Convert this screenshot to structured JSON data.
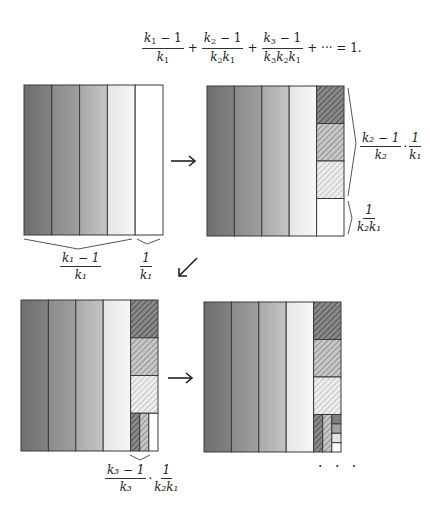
{
  "equation": {
    "terms": [
      {
        "num_var": "k",
        "num_sub": "1",
        "num_rest": " − 1",
        "den": [
          [
            "k",
            "1"
          ]
        ]
      },
      {
        "num_var": "k",
        "num_sub": "2",
        "num_rest": " − 1",
        "den": [
          [
            "k",
            "2"
          ],
          [
            "k",
            "1"
          ]
        ]
      },
      {
        "num_var": "k",
        "num_sub": "3",
        "num_rest": " − 1",
        "den": [
          [
            "k",
            "3"
          ],
          [
            "k",
            "2"
          ],
          [
            "k",
            "1"
          ]
        ]
      }
    ],
    "plus": "+",
    "tail": "+ ··· = 1."
  },
  "labels": {
    "step1_left_brace": {
      "num": "k₁ − 1",
      "den": "k₁"
    },
    "step1_right_brace": {
      "num": "1",
      "den": "k₁"
    },
    "step2_upper_brace": {
      "a_num": "k₂ − 1",
      "a_den": "k₂",
      "dot": "·",
      "b_num": "1",
      "b_den": "k₁"
    },
    "step2_lower_brace": {
      "num": "1",
      "den": "k₂k₁"
    },
    "step3_brace": {
      "a_num": "k₃ − 1",
      "a_den": "k₃",
      "dot": "·",
      "b_num": "1",
      "b_den": "k₂k₁"
    }
  },
  "arrows": {
    "right": "→",
    "down_left": "↙"
  },
  "ellipsis": "· · ·",
  "colors": {
    "strip1": "#7a7a7a",
    "strip2": "#959595",
    "strip3": "#b6b6b6",
    "strip4": "#ededed",
    "white": "#ffffff",
    "outline": "#3a3a3a",
    "hatch": "#555555"
  }
}
